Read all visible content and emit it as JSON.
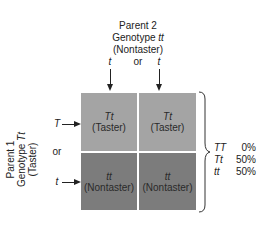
{
  "parent2": {
    "title": "Parent 2",
    "genotype_label": "Genotype",
    "genotype": "tt",
    "phenotype": "(Nontaster)",
    "allele_left": "t",
    "or": "or",
    "allele_right": "t"
  },
  "parent1": {
    "title": "Parent 1",
    "genotype_label": "Genotype",
    "genotype": "Tt",
    "phenotype": "(Taster)",
    "allele_top": "T",
    "or": "or",
    "allele_bottom": "t"
  },
  "grid": [
    {
      "genotype": "Tt",
      "phenotype": "(Taster)"
    },
    {
      "genotype": "Tt",
      "phenotype": "(Taster)"
    },
    {
      "genotype": "tt",
      "phenotype": "(Nontaster)"
    },
    {
      "genotype": "tt",
      "phenotype": "(Nontaster)"
    }
  ],
  "results": [
    {
      "genotype": "TT",
      "percent": "0%"
    },
    {
      "genotype": "Tt",
      "percent": "50%"
    },
    {
      "genotype": "tt",
      "percent": "50%"
    }
  ],
  "colors": {
    "taster_cell": "#a4a4a4",
    "nontaster_cell": "#7c7c7c"
  }
}
